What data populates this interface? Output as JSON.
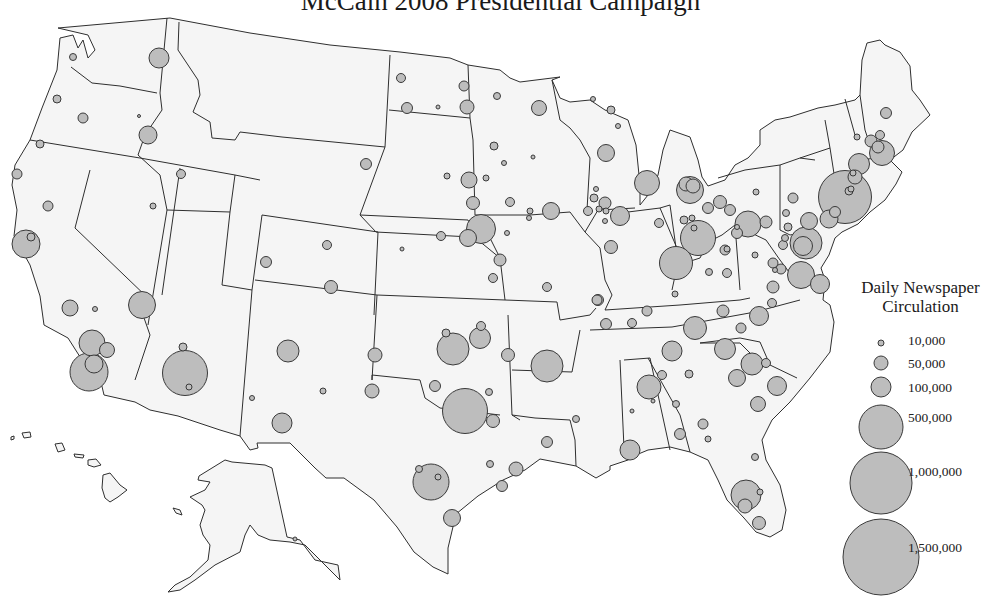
{
  "title": "McCain 2008 Presidential Campaign",
  "legend": {
    "title_line1": "Daily Newspaper",
    "title_line2": "Circulation",
    "items": [
      {
        "label": "10,000",
        "r": 3,
        "cy": 343
      },
      {
        "label": "50,000",
        "r": 7,
        "cy": 363
      },
      {
        "label": "100,000",
        "r": 10,
        "cy": 387
      },
      {
        "label": "500,000",
        "r": 22,
        "cy": 427
      },
      {
        "label": "1,000,000",
        "r": 31,
        "cy": 483
      },
      {
        "label": "1,500,000",
        "r": 38,
        "cy": 557
      }
    ]
  },
  "colors": {
    "land_fill": "#f5f5f5",
    "border": "#2f2f2f",
    "bubble_fill": "#bdbdbd",
    "bubble_stroke": "#3a3a3a"
  },
  "bubbles": [
    [
      73,
      57,
      3.5
    ],
    [
      159,
      58,
      10
    ],
    [
      57,
      99,
      4
    ],
    [
      83,
      118,
      5
    ],
    [
      139,
      116,
      1.5
    ],
    [
      148,
      135,
      9
    ],
    [
      40,
      144,
      4
    ],
    [
      17,
      174,
      5
    ],
    [
      181,
      174,
      4.5
    ],
    [
      48,
      206,
      5
    ],
    [
      153,
      206,
      3
    ],
    [
      26,
      244,
      14
    ],
    [
      31,
      237,
      4
    ],
    [
      70,
      308,
      8
    ],
    [
      95,
      309,
      2.5
    ],
    [
      142,
      305,
      13.5
    ],
    [
      92,
      343,
      13
    ],
    [
      107,
      350,
      7.5
    ],
    [
      89,
      372,
      19
    ],
    [
      94,
      364,
      9
    ],
    [
      183,
      347,
      4
    ],
    [
      185,
      373,
      22.5
    ],
    [
      189,
      387,
      3
    ],
    [
      327,
      245,
      4.5
    ],
    [
      266,
      262,
      5.5
    ],
    [
      331,
      287,
      6.5
    ],
    [
      288,
      351,
      11
    ],
    [
      375,
      355,
      7
    ],
    [
      372,
      391,
      7
    ],
    [
      323,
      391,
      3
    ],
    [
      252,
      398,
      2.5
    ],
    [
      282,
      423,
      10
    ],
    [
      401,
      78,
      4.5
    ],
    [
      464,
      86,
      5
    ],
    [
      497,
      96,
      3.5
    ],
    [
      407,
      108,
      5.5
    ],
    [
      438,
      107,
      2
    ],
    [
      467,
      107,
      7
    ],
    [
      539,
      108,
      7.5
    ],
    [
      593,
      99,
      2.5
    ],
    [
      611,
      110,
      4
    ],
    [
      618,
      126,
      2.5
    ],
    [
      494,
      146,
      4
    ],
    [
      504,
      163,
      2.5
    ],
    [
      533,
      157,
      2
    ],
    [
      606,
      153,
      8.5
    ],
    [
      366,
      164,
      5.5
    ],
    [
      447,
      176,
      3
    ],
    [
      469,
      180,
      8
    ],
    [
      486,
      178,
      3
    ],
    [
      473,
      203,
      6.5
    ],
    [
      510,
      202,
      4.5
    ],
    [
      530,
      211,
      3
    ],
    [
      529,
      218,
      2.5
    ],
    [
      551,
      211,
      8.5
    ],
    [
      596,
      189,
      2.5
    ],
    [
      594,
      198,
      4
    ],
    [
      605,
      203,
      6
    ],
    [
      599,
      209,
      3
    ],
    [
      606,
      211,
      3
    ],
    [
      588,
      211,
      4.5
    ],
    [
      605,
      221,
      2.5
    ],
    [
      620,
      216,
      9.5
    ],
    [
      481,
      229,
      14.5
    ],
    [
      468,
      238,
      8.5
    ],
    [
      441,
      236,
      4.5
    ],
    [
      507,
      233,
      2.5
    ],
    [
      402,
      249,
      2
    ],
    [
      611,
      247,
      6.5
    ],
    [
      500,
      260,
      6
    ],
    [
      493,
      278,
      4.5
    ],
    [
      547,
      287,
      4.5
    ],
    [
      597,
      300,
      5
    ],
    [
      647,
      183,
      12.5
    ],
    [
      690,
      190,
      13.5
    ],
    [
      686,
      184,
      7
    ],
    [
      693,
      186,
      7
    ],
    [
      659,
      223,
      4.5
    ],
    [
      720,
      202,
      6.5
    ],
    [
      708,
      208,
      5.5
    ],
    [
      730,
      210,
      5.5
    ],
    [
      756,
      192,
      3
    ],
    [
      684,
      220,
      4
    ],
    [
      692,
      218,
      3
    ],
    [
      698,
      238,
      17.5
    ],
    [
      694,
      228,
      3
    ],
    [
      748,
      224,
      13
    ],
    [
      737,
      227,
      2.5
    ],
    [
      737,
      233,
      5.5
    ],
    [
      676,
      263,
      16.5
    ],
    [
      725,
      250,
      5
    ],
    [
      727,
      249,
      3
    ],
    [
      755,
      255,
      3
    ],
    [
      709,
      272,
      3.5
    ],
    [
      727,
      273,
      4.5
    ],
    [
      675,
      294,
      3
    ],
    [
      598,
      300,
      5.5
    ],
    [
      647,
      311,
      5
    ],
    [
      723,
      311,
      6
    ],
    [
      606,
      324,
      5.5
    ],
    [
      632,
      323,
      4.5
    ],
    [
      695,
      328,
      11.5
    ],
    [
      741,
      328,
      5
    ],
    [
      772,
      303,
      4.5
    ],
    [
      759,
      316,
      9.5
    ],
    [
      886,
      113,
      5.5
    ],
    [
      857,
      137,
      3
    ],
    [
      871,
      141,
      6
    ],
    [
      880,
      135,
      4.5
    ],
    [
      882,
      153,
      12.5
    ],
    [
      878,
      147,
      6
    ],
    [
      859,
      164,
      10.5
    ],
    [
      845,
      197,
      26.5
    ],
    [
      855,
      177,
      7
    ],
    [
      853,
      173,
      3
    ],
    [
      849,
      191,
      4
    ],
    [
      851,
      189,
      3
    ],
    [
      793,
      198,
      5
    ],
    [
      786,
      213,
      3.5
    ],
    [
      766,
      222,
      6
    ],
    [
      788,
      227,
      4
    ],
    [
      809,
      221,
      8.5
    ],
    [
      829,
      219,
      9
    ],
    [
      835,
      212,
      5.5
    ],
    [
      806,
      243,
      16
    ],
    [
      803,
      246,
      9.5
    ],
    [
      785,
      238,
      3.5
    ],
    [
      783,
      245,
      4.5
    ],
    [
      773,
      263,
      5
    ],
    [
      781,
      269,
      5
    ],
    [
      775,
      270,
      2.5
    ],
    [
      801,
      275,
      13.5
    ],
    [
      820,
      284,
      9.5
    ],
    [
      773,
      287,
      6
    ],
    [
      453,
      349,
      16
    ],
    [
      480,
      338,
      10.5
    ],
    [
      481,
      326,
      4.5
    ],
    [
      446,
      333,
      4
    ],
    [
      508,
      355,
      6.5
    ],
    [
      547,
      366,
      16
    ],
    [
      435,
      386,
      5.5
    ],
    [
      489,
      392,
      3.5
    ],
    [
      465,
      411,
      22.5
    ],
    [
      493,
      421,
      6.5
    ],
    [
      547,
      442,
      5.5
    ],
    [
      490,
      464,
      3.5
    ],
    [
      516,
      469,
      7
    ],
    [
      431,
      482,
      18
    ],
    [
      419,
      469,
      3.5
    ],
    [
      438,
      477,
      3
    ],
    [
      502,
      486,
      5.5
    ],
    [
      452,
      518,
      8.5
    ],
    [
      576,
      419,
      3.5
    ],
    [
      672,
      351,
      10
    ],
    [
      725,
      349,
      10.5
    ],
    [
      752,
      364,
      11
    ],
    [
      766,
      363,
      4.5
    ],
    [
      737,
      378,
      8.5
    ],
    [
      777,
      386,
      9.5
    ],
    [
      758,
      404,
      7.5
    ],
    [
      662,
      375,
      4.5
    ],
    [
      649,
      387,
      12
    ],
    [
      689,
      374,
      4
    ],
    [
      653,
      401,
      2
    ],
    [
      632,
      411,
      2
    ],
    [
      676,
      404,
      3.5
    ],
    [
      703,
      424,
      5
    ],
    [
      680,
      434,
      5.5
    ],
    [
      708,
      439,
      3
    ],
    [
      630,
      450,
      10
    ],
    [
      755,
      457,
      3.5
    ],
    [
      746,
      495,
      15
    ],
    [
      760,
      492,
      3
    ],
    [
      745,
      506,
      7
    ],
    [
      759,
      523,
      6.5
    ],
    [
      295,
      539,
      2
    ]
  ]
}
